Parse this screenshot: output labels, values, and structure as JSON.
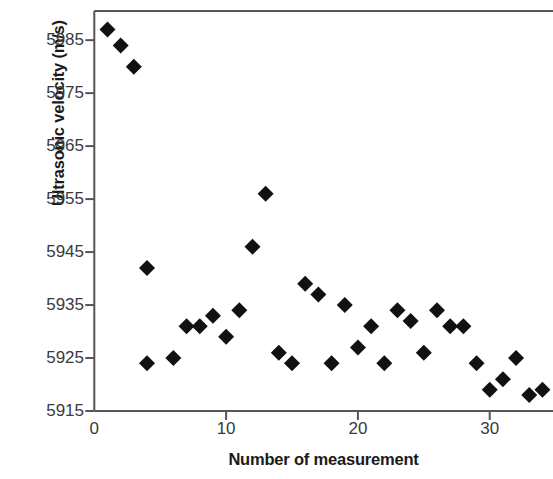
{
  "chart_data": {
    "type": "scatter",
    "title": "",
    "xlabel": "Number of measurement",
    "ylabel": "Ultrasonic velocity (m/s)",
    "xlim": [
      0,
      34.8
    ],
    "ylim": [
      5915,
      5990.5
    ],
    "xticks": [
      0,
      10,
      20,
      30
    ],
    "yticks": [
      5915,
      5925,
      5935,
      5945,
      5955,
      5965,
      5975,
      5985
    ],
    "xtick_labels": [
      "0",
      "10",
      "20",
      "30"
    ],
    "ytick_labels": [
      "5915",
      "5925",
      "5935",
      "5945",
      "5955",
      "5965",
      "5975",
      "5985"
    ],
    "grid": false,
    "legend": null,
    "marker": "diamond",
    "marker_color": "#111111",
    "marker_size": 15,
    "axis_color": "#555555",
    "series": [
      {
        "name": "Ultrasonic velocity",
        "x": [
          1,
          2,
          3,
          4,
          4,
          6,
          7,
          8,
          9,
          10,
          11,
          12,
          13,
          14,
          15,
          16,
          17,
          18,
          19,
          20,
          21,
          22,
          23,
          24,
          25,
          26,
          27,
          28,
          29,
          30,
          31,
          32,
          33,
          34
        ],
        "y": [
          5987,
          5984,
          5980,
          5942,
          5924,
          5925,
          5931,
          5931,
          5933,
          5929,
          5934,
          5946,
          5956,
          5926,
          5924,
          5939,
          5937,
          5924,
          5935,
          5927,
          5931,
          5924,
          5934,
          5932,
          5926,
          5934,
          5931,
          5931,
          5924,
          5919,
          5921,
          5925,
          5918,
          5919
        ]
      }
    ],
    "points": [
      {
        "n": 1,
        "v": 5987
      },
      {
        "n": 2,
        "v": 5984
      },
      {
        "n": 3,
        "v": 5980
      },
      {
        "n": 4,
        "v": 5942
      },
      {
        "n": 4,
        "v": 5924
      },
      {
        "n": 6,
        "v": 5925
      },
      {
        "n": 7,
        "v": 5931
      },
      {
        "n": 8,
        "v": 5931
      },
      {
        "n": 9,
        "v": 5933
      },
      {
        "n": 10,
        "v": 5929
      },
      {
        "n": 11,
        "v": 5934
      },
      {
        "n": 12,
        "v": 5946
      },
      {
        "n": 13,
        "v": 5956
      },
      {
        "n": 14,
        "v": 5926
      },
      {
        "n": 15,
        "v": 5924
      },
      {
        "n": 16,
        "v": 5939
      },
      {
        "n": 17,
        "v": 5937
      },
      {
        "n": 18,
        "v": 5924
      },
      {
        "n": 19,
        "v": 5935
      },
      {
        "n": 20,
        "v": 5927
      },
      {
        "n": 21,
        "v": 5931
      },
      {
        "n": 22,
        "v": 5924
      },
      {
        "n": 23,
        "v": 5934
      },
      {
        "n": 24,
        "v": 5932
      },
      {
        "n": 25,
        "v": 5926
      },
      {
        "n": 26,
        "v": 5934
      },
      {
        "n": 27,
        "v": 5931
      },
      {
        "n": 28,
        "v": 5931
      },
      {
        "n": 29,
        "v": 5924
      },
      {
        "n": 30,
        "v": 5919
      },
      {
        "n": 31,
        "v": 5921
      },
      {
        "n": 32,
        "v": 5925
      },
      {
        "n": 33,
        "v": 5918
      },
      {
        "n": 34,
        "v": 5919
      }
    ]
  },
  "axes": {
    "x_title": "Number of measurement",
    "y_title": "Ultrasonic velocity (m/s)"
  }
}
